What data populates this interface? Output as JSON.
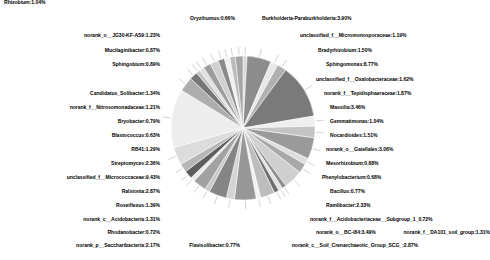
{
  "chart_data": {
    "type": "pie",
    "title": "",
    "subtitle": "",
    "xlabel": "",
    "ylabel": "",
    "legend_position": "none",
    "grid": false,
    "label_format": "name:percent",
    "total_percent": 100.0,
    "center": {
      "x": 243,
      "y": 128,
      "radius": 72
    },
    "start_angle_deg": -90,
    "direction": "clockwise",
    "slices": [
      {
        "name": "Oryzihumus",
        "percent": 0.66,
        "label": "Oryzihumus:0.66%",
        "color": "#d9d9d9"
      },
      {
        "name": "Burkholderia-Paraburkholderia",
        "percent": 3.9,
        "label": "Burkholderia-Paraburkholderia:3.90%",
        "color": "#8c8c8c"
      },
      {
        "name": "unclassified_f__Micromonosporaceae",
        "percent": 1.19,
        "label": "unclassified_f__Micromonosporaceae:1.19%",
        "color": "#e8e8e8"
      },
      {
        "name": "Bradyrhizobium",
        "percent": 1.5,
        "label": "Bradyrhizobium:1.50%",
        "color": "#b0b0b0"
      },
      {
        "name": "Sphingomonas",
        "percent": 8.77,
        "label": "Sphingomonas:8.77%",
        "color": "#7a7a7a"
      },
      {
        "name": "unclassified_f__Oxalobacteraceae",
        "percent": 1.62,
        "label": "unclassified_f__Oxalobacteraceae:1.62%",
        "color": "#efefef"
      },
      {
        "name": "norank_f__Tepidisphaeraceae",
        "percent": 1.87,
        "label": "norank_f__Tepidisphaeraceae:1.87%",
        "color": "#c4c4c4"
      },
      {
        "name": "Massilia",
        "percent": 3.46,
        "label": "Massilia:3.46%",
        "color": "#9a9a9a"
      },
      {
        "name": "Gemmatimonas",
        "percent": 1.04,
        "label": "Gemmatimonas:1.04%",
        "color": "#dedede"
      },
      {
        "name": "Nocardioides",
        "percent": 1.51,
        "label": "Nocardioides:1.51%",
        "color": "#a8a8a8"
      },
      {
        "name": "norank_o__Gaiellales",
        "percent": 3.06,
        "label": "norank_o__Gaiellales:3.06%",
        "color": "#cfcfcf"
      },
      {
        "name": "Mesorhizobium",
        "percent": 0.68,
        "label": "Mesorhizobium:0.68%",
        "color": "#8f8f8f"
      },
      {
        "name": "Phenylobacterium",
        "percent": 0.68,
        "label": "Phenylobacterium:0.68%",
        "color": "#e3e3e3"
      },
      {
        "name": "Bacillus",
        "percent": 0.77,
        "label": "Bacillus:0.77%",
        "color": "#6e6e6e"
      },
      {
        "name": "Ramlibacter",
        "percent": 2.33,
        "label": "Ramlibacter:2.33%",
        "color": "#bdbdbd"
      },
      {
        "name": "norank_f__Acidobacteriaceae__Subgroup_1",
        "percent": 0.72,
        "label": "norank_f__Acidobacteriaceae__Subgroup_1_0.72%",
        "color": "#f2f2f2"
      },
      {
        "name": "norank_o__BC-i84",
        "percent": 3.49,
        "label": "norank_o__BC-i84:3.49%",
        "color": "#979797"
      },
      {
        "name": "norank_f__DA101_soil_group",
        "percent": 1.31,
        "label": "norank_f__DA101_soil_group:1.31%",
        "color": "#d4d4d4"
      },
      {
        "name": "norank_c__Soil_Crenarchaeotic_Group_SCG_",
        "percent": 2.87,
        "label": "norank_c__Soil_Crenarchaeotic_Group_SCG_:2.87%",
        "color": "#858585"
      },
      {
        "name": "Flavisolibacter",
        "percent": 0.77,
        "label": "Flavisolibacter:0.77%",
        "color": "#c9c9c9"
      },
      {
        "name": "norank_p__Saccharibacteria",
        "percent": 2.17,
        "label": "norank_p__Saccharibacteria:2.17%",
        "color": "#a2a2a2"
      },
      {
        "name": "Rhodanobacter",
        "percent": 0.72,
        "label": "Rhodanobacter:0.72%",
        "color": "#ebebeb"
      },
      {
        "name": "norank_c__Acidobacteria",
        "percent": 1.31,
        "label": "norank_c__Acidobacteria:1.31%",
        "color": "#5e5e5e"
      },
      {
        "name": "Roseiflexus",
        "percent": 1.39,
        "label": "Roseiflexus:1.39%",
        "color": "#b6b6b6"
      },
      {
        "name": "Ralstonia",
        "percent": 2.87,
        "label": "Ralstonia:2.87%",
        "color": "#dcdcdc"
      },
      {
        "name": "unclassified_f__Micrococcaceae",
        "percent": 9.43,
        "label": "unclassified_f__Micrococcaceae:9.43%",
        "color": "#ededed"
      },
      {
        "name": "Streptomyces",
        "percent": 2.36,
        "label": "Streptomyces:2.36%",
        "color": "#adadad"
      },
      {
        "name": "RB41",
        "percent": 1.29,
        "label": "RB41:1.29%",
        "color": "#767676"
      },
      {
        "name": "Blastococcus",
        "percent": 0.63,
        "label": "Blastococcus:0.63%",
        "color": "#c2c2c2"
      },
      {
        "name": "Bryobacter",
        "percent": 0.79,
        "label": "Bryobacter:0.79%",
        "color": "#e0e0e0"
      },
      {
        "name": "norank_f__Nitrosomonadaceae",
        "percent": 1.21,
        "label": "norank_f__Nitrosomonadaceae:1.21%",
        "color": "#9e9e9e"
      },
      {
        "name": "Candidatus_Solibacter",
        "percent": 1.34,
        "label": "Candidatus_Solibacter:1.34%",
        "color": "#d0d0d0"
      },
      {
        "name": "Rhizobium",
        "percent": 1.04,
        "label": "Rhizobium:1.04%",
        "color": "#8a8a8a"
      },
      {
        "name": "Sphingobium",
        "percent": 0.89,
        "label": "Sphingobium:0.89%",
        "color": "#f0f0f0"
      },
      {
        "name": "Mucilaginibacter",
        "percent": 0.87,
        "label": "Mucilaginibacter:0.87%",
        "color": "#bababa"
      },
      {
        "name": "norank_o__JG30-KF-AS9",
        "percent": 1.23,
        "label": "norank_o__JG30-KF-AS9:1.23%",
        "color": "#a5a5a5"
      }
    ]
  },
  "labels": {
    "oryzihumus": "Oryzihumus:0.66%",
    "burkholderia": "Burkholderia-Paraburkholderia:3.90%",
    "micromonosporaceae": "unclassified_f__Micromonosporaceae:1.19%",
    "bradyrhizobium": "Bradyrhizobium:1.50%",
    "sphingomonas": "Sphingomonas:8.77%",
    "oxalobacteraceae": "unclassified_f__Oxalobacteraceae:1.62%",
    "tepidisphaeraceae": "norank_f__Tepidisphaeraceae:1.87%",
    "massilia": "Massilia:3.46%",
    "gemmatimonas": "Gemmatimonas:1.04%",
    "nocardioides": "Nocardioides:1.51%",
    "gaiellales": "norank_o__Gaiellales:3.06%",
    "mesorhizobium": "Mesorhizobium:0.68%",
    "phenylobacterium": "Phenylobacterium:0.68%",
    "bacillus": "Bacillus:0.77%",
    "ramlibacter": "Ramlibacter:2.33%",
    "acidobacteriaceae_subgroup1": "norank_f__Acidobacteriaceae__Subgroup_1_0.72%",
    "bc_i84": "norank_o__BC-i84:3.49%",
    "da101": "norank_f__DA101_soil_group:1.31%",
    "scg": "norank_c__Soil_Crenarchaeotic_Group_SCG_:2.87%",
    "flavisolibacter": "Flavisolibacter:0.77%",
    "saccharibacteria": "norank_p__Saccharibacteria:2.17%",
    "rhodanobacter": "Rhodanobacter:0.72%",
    "acidobacteria": "norank_c__Acidobacteria:1.31%",
    "roseiflexus": "Roseiflexus:1.39%",
    "ralstonia": "Ralstonia:2.87%",
    "micrococcaceae": "unclassified_f__Micrococcaceae:9.43%",
    "streptomyces": "Streptomyces:2.36%",
    "rb41": "RB41:1.29%",
    "blastococcus": "Blastococcus:0.63%",
    "bryobacter": "Bryobacter:0.79%",
    "nitrosomonadaceae": "norank_f__Nitrosomonadaceae:1.21%",
    "candidatus_solibacter": "Candidatus_Solibacter:1.34%",
    "rhizobium": "Rhizobium:1.04%",
    "sphingobium": "Sphingobium:0.89%",
    "mucilaginibacter": "Mucilaginibacter:0.87%",
    "jg30": "norank_o__JG30-KF-AS9:1.23%"
  }
}
